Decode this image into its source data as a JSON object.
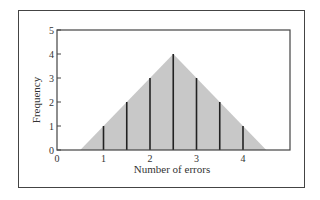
{
  "chart_data": {
    "type": "bar",
    "subtype": "stem-with-triangular-area",
    "title": "",
    "xlabel": "Number of errors",
    "ylabel": "Frequency",
    "x": [
      1,
      1.5,
      2,
      2.5,
      3,
      3.5,
      4
    ],
    "values": [
      1,
      2,
      3,
      4,
      3,
      2,
      1
    ],
    "area_polygon": [
      [
        0.5,
        0
      ],
      [
        2.5,
        4
      ],
      [
        4.5,
        0
      ]
    ],
    "xticks": [
      0,
      1,
      2,
      3,
      4
    ],
    "yticks": [
      0,
      1,
      2,
      3,
      4,
      5
    ],
    "xlim": [
      0,
      5
    ],
    "ylim": [
      0,
      5
    ],
    "grid": false,
    "legend": null,
    "colors": {
      "fill": "#c8c8c8",
      "stem": "#222222",
      "axis": "#444444"
    }
  },
  "labels": {
    "xlabel": "Number of errors",
    "ylabel": "Frequency"
  }
}
